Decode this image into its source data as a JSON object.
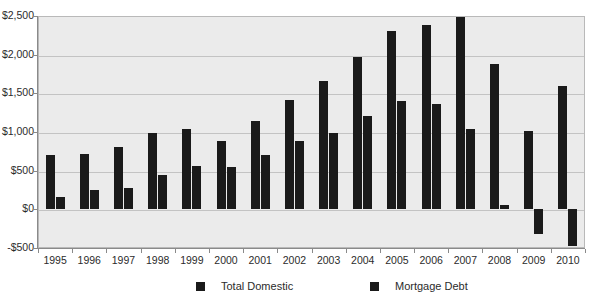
{
  "chart_data": {
    "type": "bar",
    "title": "",
    "xlabel": "",
    "ylabel": "",
    "grid": true,
    "legend_position": "bottom",
    "ylim": [
      -500,
      2500
    ],
    "ytick_labels": [
      "$2,500",
      "$2,000",
      "$1,500",
      "$1,000",
      "$500",
      "$0",
      "-$500"
    ],
    "ytick_values": [
      2500,
      2000,
      1500,
      1000,
      500,
      0,
      -500
    ],
    "categories": [
      "1995",
      "1996",
      "1997",
      "1998",
      "1999",
      "2000",
      "2001",
      "2002",
      "2003",
      "2004",
      "2005",
      "2006",
      "2007",
      "2008",
      "2009",
      "2010"
    ],
    "series": [
      {
        "name": "Total Domestic",
        "values": [
          700,
          715,
          810,
          985,
          1040,
          880,
          1140,
          1410,
          1660,
          1975,
          2310,
          2390,
          2490,
          1880,
          1010,
          1600
        ]
      },
      {
        "name": "Mortgage Debt",
        "values": [
          165,
          245,
          270,
          440,
          560,
          550,
          700,
          890,
          990,
          1210,
          1395,
          1360,
          1040,
          55,
          -320,
          -480
        ]
      }
    ],
    "colors": {
      "series_1": "#1a1a1a",
      "series_2": "#1a1a1a",
      "plot_background": "#ebebeb",
      "gridline": "#c3c3c3",
      "axis": "#8a8a8a",
      "text": "#2b2b2b"
    }
  }
}
